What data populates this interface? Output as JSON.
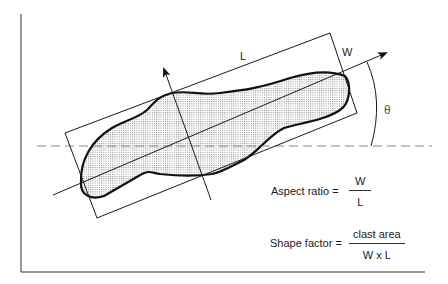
{
  "figure": {
    "type": "clast shape measurement diagram",
    "labels": {
      "length": "L",
      "width": "W",
      "angle": "θ"
    },
    "formulas": {
      "aspect_ratio": {
        "lhs": "Aspect ratio =",
        "numerator": "W",
        "denominator": "L"
      },
      "shape_factor": {
        "lhs": "Shape factor =",
        "numerator": "clast area",
        "denominator": "W x L"
      }
    },
    "colors": {
      "stroke": "#1a1a1a",
      "dashed": "#888888",
      "fill_stipple": "#9a9a9a",
      "background": "#ffffff"
    }
  }
}
